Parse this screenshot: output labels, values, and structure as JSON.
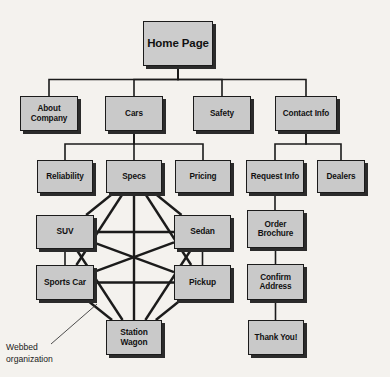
{
  "diagram": {
    "background_color": "#f4f2ee",
    "node_fill_color": "#c9c9c9",
    "node_border_color": "#1b1b1b",
    "shadow_color": "#2b2b2b",
    "line_color": "#1b1b1b",
    "annotation": {
      "text": "Webbed\norganization"
    },
    "nodes": [
      {
        "id": "home",
        "label": "Home Page",
        "x": 143,
        "y": 21,
        "w": 70,
        "h": 45,
        "level": "root"
      },
      {
        "id": "about",
        "label": "About\nCompany",
        "x": 20,
        "y": 96,
        "w": 58,
        "h": 35,
        "level": "lvl2"
      },
      {
        "id": "cars",
        "label": "Cars",
        "x": 105,
        "y": 96,
        "w": 58,
        "h": 35,
        "level": "lvl2"
      },
      {
        "id": "safety",
        "label": "Safety",
        "x": 193,
        "y": 96,
        "w": 58,
        "h": 35,
        "level": "lvl2"
      },
      {
        "id": "contact",
        "label": "Contact Info",
        "x": 275,
        "y": 96,
        "w": 62,
        "h": 35,
        "level": "lvl2"
      },
      {
        "id": "reliability",
        "label": "Reliability",
        "x": 37,
        "y": 160,
        "w": 56,
        "h": 33,
        "level": "lvl3"
      },
      {
        "id": "specs",
        "label": "Specs",
        "x": 106,
        "y": 160,
        "w": 56,
        "h": 33,
        "level": "lvl3"
      },
      {
        "id": "pricing",
        "label": "Pricing",
        "x": 175,
        "y": 160,
        "w": 56,
        "h": 33,
        "level": "lvl3"
      },
      {
        "id": "requestinfo",
        "label": "Request Info",
        "x": 246,
        "y": 160,
        "w": 58,
        "h": 33,
        "level": "lvl3"
      },
      {
        "id": "dealers",
        "label": "Dealers",
        "x": 317,
        "y": 160,
        "w": 48,
        "h": 33,
        "level": "lvl3"
      },
      {
        "id": "suv",
        "label": "SUV",
        "x": 36,
        "y": 215,
        "w": 58,
        "h": 34,
        "level": "web"
      },
      {
        "id": "sedan",
        "label": "Sedan",
        "x": 174,
        "y": 215,
        "w": 57,
        "h": 34,
        "level": "web"
      },
      {
        "id": "sportscar",
        "label": "Sports Car",
        "x": 36,
        "y": 265,
        "w": 58,
        "h": 35,
        "level": "web"
      },
      {
        "id": "pickup",
        "label": "Pickup",
        "x": 174,
        "y": 265,
        "w": 57,
        "h": 35,
        "level": "web"
      },
      {
        "id": "stationwagon",
        "label": "Station\nWagon",
        "x": 106,
        "y": 320,
        "w": 56,
        "h": 35,
        "level": "web"
      },
      {
        "id": "orderbrochure",
        "label": "Order\nBrochure",
        "x": 247,
        "y": 210,
        "w": 57,
        "h": 38,
        "level": "flow"
      },
      {
        "id": "confirm",
        "label": "Confirm\nAddress",
        "x": 247,
        "y": 264,
        "w": 57,
        "h": 36,
        "level": "flow"
      },
      {
        "id": "thankyou",
        "label": "Thank You!",
        "x": 248,
        "y": 320,
        "w": 56,
        "h": 35,
        "level": "flow"
      }
    ],
    "tree_edges": [
      {
        "from": "home",
        "to": "about"
      },
      {
        "from": "home",
        "to": "cars"
      },
      {
        "from": "home",
        "to": "safety"
      },
      {
        "from": "home",
        "to": "contact"
      },
      {
        "from": "cars",
        "to": "reliability"
      },
      {
        "from": "cars",
        "to": "specs"
      },
      {
        "from": "cars",
        "to": "pricing"
      },
      {
        "from": "contact",
        "to": "requestinfo"
      },
      {
        "from": "contact",
        "to": "dealers"
      },
      {
        "from": "requestinfo",
        "to": "orderbrochure"
      },
      {
        "from": "orderbrochure",
        "to": "confirm"
      },
      {
        "from": "confirm",
        "to": "thankyou"
      },
      {
        "from": "suv",
        "to": "sportscar"
      },
      {
        "from": "sedan",
        "to": "pickup"
      }
    ],
    "web_edges": [
      {
        "from": "specs",
        "to": "suv"
      },
      {
        "from": "specs",
        "to": "sportscar"
      },
      {
        "from": "specs",
        "to": "sedan"
      },
      {
        "from": "specs",
        "to": "pickup"
      },
      {
        "from": "specs",
        "to": "stationwagon"
      },
      {
        "from": "suv",
        "to": "sedan"
      },
      {
        "from": "suv",
        "to": "pickup"
      },
      {
        "from": "suv",
        "to": "stationwagon"
      },
      {
        "from": "sportscar",
        "to": "sedan"
      },
      {
        "from": "sportscar",
        "to": "pickup"
      },
      {
        "from": "sportscar",
        "to": "stationwagon"
      },
      {
        "from": "sedan",
        "to": "stationwagon"
      },
      {
        "from": "pickup",
        "to": "stationwagon"
      }
    ]
  }
}
